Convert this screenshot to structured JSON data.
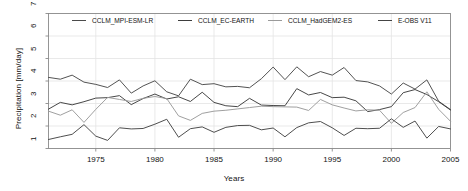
{
  "chart_data": {
    "type": "line",
    "title": "",
    "xlabel": "Years",
    "ylabel": "Precipitation [mm/day]",
    "xlim": [
      1971,
      2005
    ],
    "ylim": [
      1,
      7
    ],
    "xticks": [
      1975,
      1980,
      1985,
      1990,
      1995,
      2000,
      2005
    ],
    "yticks": [
      1,
      2,
      3,
      4,
      5,
      6,
      7
    ],
    "grid": true,
    "legend_position": "top-inside",
    "x": [
      1971,
      1972,
      1973,
      1974,
      1975,
      1976,
      1977,
      1978,
      1979,
      1980,
      1981,
      1982,
      1983,
      1984,
      1985,
      1986,
      1987,
      1988,
      1989,
      1990,
      1991,
      1992,
      1993,
      1994,
      1995,
      1996,
      1997,
      1998,
      1999,
      2000,
      2001,
      2002,
      2003,
      2004,
      2005
    ],
    "series": [
      {
        "name": "CCLM_MPI-ESM-LR",
        "color": "#4a4a4a",
        "values": [
          4.16,
          4.08,
          4.26,
          3.95,
          3.85,
          3.71,
          4.05,
          3.46,
          3.78,
          4.01,
          3.52,
          3.34,
          4.08,
          3.84,
          3.88,
          3.74,
          3.76,
          3.7,
          4.1,
          4.62,
          4.06,
          4.63,
          4.19,
          4.42,
          4.26,
          4.6,
          4.02,
          3.96,
          3.78,
          3.42,
          3.91,
          3.64,
          4.05,
          3.1,
          2.73
        ]
      },
      {
        "name": "CCLM_EC-EARTH",
        "color": "#3d3d3d",
        "values": [
          2.75,
          3.05,
          2.94,
          3.08,
          3.24,
          3.26,
          3.35,
          2.95,
          3.22,
          3.42,
          3.2,
          3.3,
          3.09,
          3.5,
          3.05,
          2.9,
          2.86,
          3.23,
          2.93,
          2.91,
          2.9,
          3.66,
          3.38,
          3.49,
          3.26,
          3.28,
          3.12,
          2.64,
          2.73,
          2.86,
          3.48,
          3.62,
          3.4,
          3.08,
          2.71
        ]
      },
      {
        "name": "CCLM_HadGEM2-ES",
        "color": "#9a9a9a",
        "values": [
          2.66,
          2.48,
          2.72,
          2.16,
          2.74,
          3.27,
          3.18,
          3.09,
          3.23,
          3.31,
          3.22,
          2.45,
          2.25,
          2.56,
          2.66,
          2.7,
          2.76,
          2.82,
          2.88,
          2.86,
          2.85,
          2.84,
          2.69,
          3.18,
          2.94,
          2.8,
          2.67,
          2.72,
          2.7,
          2.12,
          2.6,
          2.82,
          3.52,
          2.74,
          2.21
        ]
      },
      {
        "name": "E-OBS V11",
        "color": "#444444",
        "values": [
          1.4,
          1.52,
          1.63,
          2.06,
          1.55,
          1.36,
          1.92,
          1.87,
          1.89,
          2.08,
          2.3,
          1.5,
          1.88,
          1.96,
          1.72,
          1.94,
          2.02,
          2.03,
          1.83,
          1.91,
          1.52,
          1.93,
          2.14,
          2.2,
          1.92,
          1.58,
          1.9,
          1.88,
          1.9,
          2.32,
          1.94,
          2.22,
          1.46,
          1.98,
          1.87
        ]
      }
    ]
  },
  "legend": {
    "items": [
      {
        "label": "CCLM_MPI-ESM-LR",
        "x": 72,
        "text_x": 92
      },
      {
        "label": "CCLM_EC-EARTH",
        "x": 178,
        "text_x": 198
      },
      {
        "label": "CCLM_HadGEM2-ES",
        "x": 268,
        "text_x": 288
      },
      {
        "label": "E-OBS V11",
        "x": 378,
        "text_x": 398
      }
    ]
  },
  "axes": {
    "ylabel": "Precipitation [mm/day]",
    "xlabel": "Years",
    "xticks": [
      "1975",
      "1980",
      "1985",
      "1990",
      "1995",
      "2000",
      "2005"
    ],
    "yticks": [
      "1",
      "2",
      "3",
      "4",
      "5",
      "6",
      "7"
    ]
  },
  "colors": {
    "frame": "#8a8a8a",
    "grid": "#e3e3e3",
    "text": "#121212"
  }
}
